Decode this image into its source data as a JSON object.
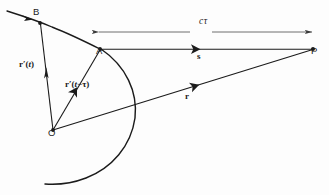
{
  "figure": {
    "kind": "physics-vector-diagram",
    "ink_color": "#1b1b1b",
    "background_color": "#fdfdfd",
    "points": [
      {
        "id": "B",
        "label": "B",
        "x": 40,
        "y": 23,
        "label_x": 33,
        "label_y": 15
      },
      {
        "id": "A",
        "label": "A",
        "x": 100,
        "y": 49,
        "label_x": 96,
        "label_y": 54
      },
      {
        "id": "O",
        "label": "O",
        "x": 53,
        "y": 130,
        "label_x": 48,
        "label_y": 136
      },
      {
        "id": "P",
        "label": "P",
        "x": 313,
        "y": 49,
        "label_x": 311,
        "label_y": 54
      }
    ],
    "vectors": [
      {
        "id": "r-prime-t",
        "from": "O",
        "to": "B",
        "label_html": "<b>r</b>′(<i>t</i>)",
        "label_x": 19,
        "label_y": 68
      },
      {
        "id": "r-prime-t-tau",
        "from": "O",
        "to": "A",
        "label_html": "<b>r</b>′(<i>t</i>−τ)",
        "label_x": 65,
        "label_y": 82
      },
      {
        "id": "s-vector",
        "from": "A",
        "to": "P",
        "label_html": "<b>s</b>",
        "label_x": 197,
        "label_y": 53
      },
      {
        "id": "r-vector",
        "from": "O",
        "to": "P",
        "label_html": "<b>r</b>",
        "label_x": 185,
        "label_y": 93
      }
    ],
    "dimension": {
      "id": "c-tau",
      "label": "cτ",
      "label_x": 199,
      "label_y": 25,
      "from_x": 98,
      "to_x": 313,
      "y": 32,
      "double_headed": true
    },
    "curves": [
      {
        "id": "source-trajectory",
        "description": "charge path through B and A"
      },
      {
        "id": "retarded-sphere-arc",
        "description": "spherical wavefront arc from A"
      }
    ],
    "caption": ""
  }
}
